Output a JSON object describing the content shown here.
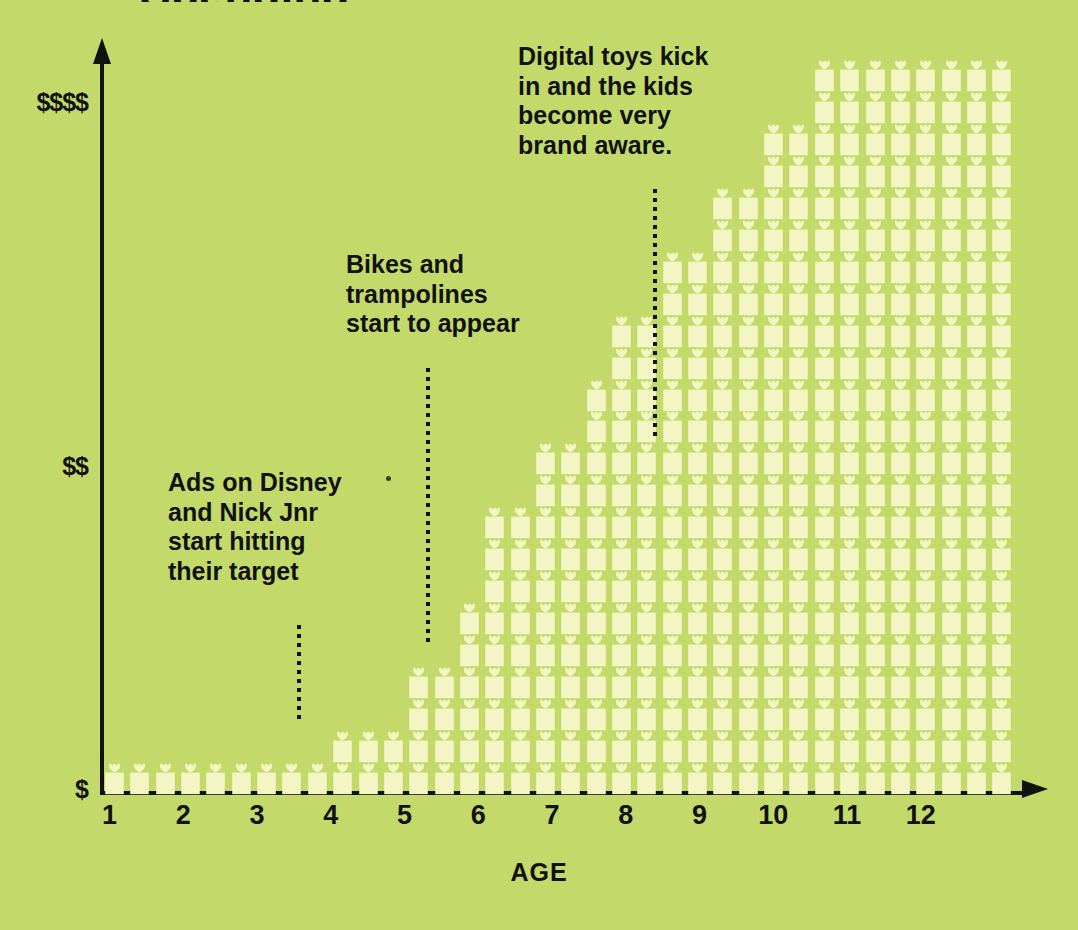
{
  "figure": {
    "background_color": "#c3da6b",
    "gift_color": "#f3f6c4",
    "ink_color": "#111111",
    "clipped_title": "Spending"
  },
  "axes": {
    "x_label": "AGE",
    "x_ticks": [
      "1",
      "2",
      "3",
      "4",
      "5",
      "6",
      "7",
      "8",
      "9",
      "10",
      "11",
      "12"
    ],
    "y_ticks": [
      "$",
      "$$",
      "$$$$"
    ],
    "y_tick_positions": [
      0,
      0.5,
      1.0
    ]
  },
  "annotations": [
    {
      "id": "ads-disney",
      "lines": [
        "Ads on Disney",
        "and Nick Jnr",
        "start hitting",
        "their target"
      ],
      "text": "Ads on Disney and Nick Jnr start hitting their target",
      "points_to_age": 3.5
    },
    {
      "id": "bikes-trampolines",
      "lines": [
        "Bikes and",
        "trampolines",
        "start to appear"
      ],
      "text": "Bikes and trampolines start to appear",
      "points_to_age": 5.0
    },
    {
      "id": "digital-toys",
      "lines": [
        "Digital toys kick",
        "in and the kids",
        "become very",
        "brand aware."
      ],
      "text": "Digital toys kick in and the kids become very brand aware.",
      "points_to_age": 8.0
    }
  ],
  "chart_data": {
    "type": "bar",
    "title": "",
    "subtitle": "",
    "xlabel": "AGE",
    "ylabel": "",
    "unit": "one gift icon = one unit of spend",
    "categories": [
      "1",
      "2",
      "3",
      "4",
      "5",
      "6",
      "7",
      "8",
      "9",
      "10",
      "11",
      "12"
    ],
    "values": [
      2,
      1,
      2,
      4,
      6,
      8,
      10,
      13,
      17,
      21,
      23,
      23
    ],
    "ylim": [
      0,
      24
    ],
    "xlim": [
      0.5,
      12.5
    ],
    "grid": false,
    "legend": false,
    "note": "Pictogram: stacked gift icons, 3 icon-columns per age year, 23 icon-rows tall at the maximum.",
    "icon_grid": {
      "columns": 36,
      "rows": 23,
      "icons_per_age": 3,
      "row_start_column": [
        0,
        9,
        12,
        12,
        14,
        14,
        15,
        15,
        15,
        17,
        17,
        19,
        19,
        20,
        20,
        22,
        22,
        24,
        24,
        26,
        26,
        28,
        28
      ],
      "row_end_column": [
        36,
        36,
        36,
        36,
        36,
        36,
        36,
        36,
        36,
        36,
        36,
        36,
        36,
        36,
        36,
        36,
        36,
        36,
        36,
        36,
        36,
        36,
        36
      ],
      "row_gaps": [
        [],
        [
          3,
          9
        ],
        [],
        [],
        [],
        [],
        [],
        [],
        [],
        [],
        [],
        [],
        [],
        [],
        [],
        [],
        [],
        [],
        [],
        [],
        [],
        [],
        []
      ]
    }
  }
}
